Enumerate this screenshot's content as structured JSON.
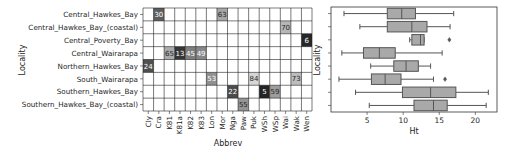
{
  "chart_data": [
    {
      "type": "heatmap",
      "title": "",
      "xlabel": "Abbrev",
      "ylabel": "Locality",
      "columns": [
        "Cly",
        "Cra",
        "K81",
        "K81a",
        "K82",
        "K83",
        "Lon",
        "Mor",
        "Nga",
        "Paw",
        "Puk",
        "WSh",
        "WSp",
        "Wai",
        "Wak",
        "Wen"
      ],
      "rows": [
        "Central_Hawkes_Bay",
        "Central_Hawkes_Bay_(coastal)",
        "Central_Poverty_Bay",
        "Central_Wairarapa",
        "Northern_Hawkes_Bay",
        "South_Wairarapa",
        "Southern_Hawkes_Bay",
        "Southern_Hawkes_Bay_(coastal)"
      ],
      "cells": [
        {
          "row": "Central_Hawkes_Bay",
          "col": "Cra",
          "value": 30
        },
        {
          "row": "Central_Hawkes_Bay",
          "col": "Mor",
          "value": 63
        },
        {
          "row": "Central_Hawkes_Bay_(coastal)",
          "col": "Wai",
          "value": 70
        },
        {
          "row": "Central_Poverty_Bay",
          "col": "Wen",
          "value": 6
        },
        {
          "row": "Central_Wairarapa",
          "col": "K81",
          "value": 65
        },
        {
          "row": "Central_Wairarapa",
          "col": "K81a",
          "value": 13
        },
        {
          "row": "Central_Wairarapa",
          "col": "K82",
          "value": 45
        },
        {
          "row": "Central_Wairarapa",
          "col": "K83",
          "value": 49
        },
        {
          "row": "Northern_Hawkes_Bay",
          "col": "Cly",
          "value": 24
        },
        {
          "row": "South_Wairarapa",
          "col": "Lon",
          "value": 53
        },
        {
          "row": "South_Wairarapa",
          "col": "Puk",
          "value": 84
        },
        {
          "row": "South_Wairarapa",
          "col": "Wak",
          "value": 73
        },
        {
          "row": "Southern_Hawkes_Bay",
          "col": "Nga",
          "value": 22
        },
        {
          "row": "Southern_Hawkes_Bay",
          "col": "WSh",
          "value": 5
        },
        {
          "row": "Southern_Hawkes_Bay",
          "col": "WSp",
          "value": 59
        },
        {
          "row": "Southern_Hawkes_Bay_(coastal)",
          "col": "Paw",
          "value": 55
        }
      ],
      "colormap": "grey (dark = low, light = high)",
      "value_range": [
        0,
        100
      ],
      "grid": true
    },
    {
      "type": "box",
      "orientation": "horizontal",
      "title": "",
      "xlabel": "Ht",
      "ylabel": "Locality",
      "xlim": [
        0,
        23
      ],
      "xticks": [
        5,
        10,
        15,
        20
      ],
      "categories": [
        "Central_Hawkes_Bay",
        "Central_Hawkes_Bay_(coastal)",
        "Central_Poverty_Bay",
        "Central_Wairarapa",
        "Northern_Hawkes_Bay",
        "South_Wairarapa",
        "Southern_Hawkes_Bay",
        "Southern_Hawkes_Bay_(coastal)"
      ],
      "show_category_labels": false,
      "boxes": [
        {
          "whislo": 1.8,
          "q1": 7.8,
          "med": 9.8,
          "q3": 11.7,
          "whishi": 17.0,
          "fliers": []
        },
        {
          "whislo": 4.0,
          "q1": 7.8,
          "med": 11.2,
          "q3": 13.3,
          "whishi": 16.5,
          "fliers": []
        },
        {
          "whislo": 10.9,
          "q1": 11.2,
          "med": 12.4,
          "q3": 12.9,
          "whishi": 12.9,
          "fliers": [
            16.4
          ]
        },
        {
          "whislo": 1.5,
          "q1": 4.5,
          "med": 6.7,
          "q3": 8.9,
          "whishi": 15.4,
          "fliers": []
        },
        {
          "whislo": 5.5,
          "q1": 8.7,
          "med": 10.4,
          "q3": 12.1,
          "whishi": 13.8,
          "fliers": []
        },
        {
          "whislo": 1.1,
          "q1": 5.6,
          "med": 7.5,
          "q3": 9.7,
          "whishi": 14.2,
          "fliers": [
            15.8
          ]
        },
        {
          "whislo": 3.4,
          "q1": 9.9,
          "med": 13.8,
          "q3": 17.3,
          "whishi": 21.8,
          "fliers": []
        },
        {
          "whislo": 5.3,
          "q1": 11.5,
          "med": 14.2,
          "q3": 16.1,
          "whishi": 21.5,
          "fliers": []
        }
      ],
      "box_color": "#a9a9a9",
      "line_color": "#555555"
    }
  ]
}
